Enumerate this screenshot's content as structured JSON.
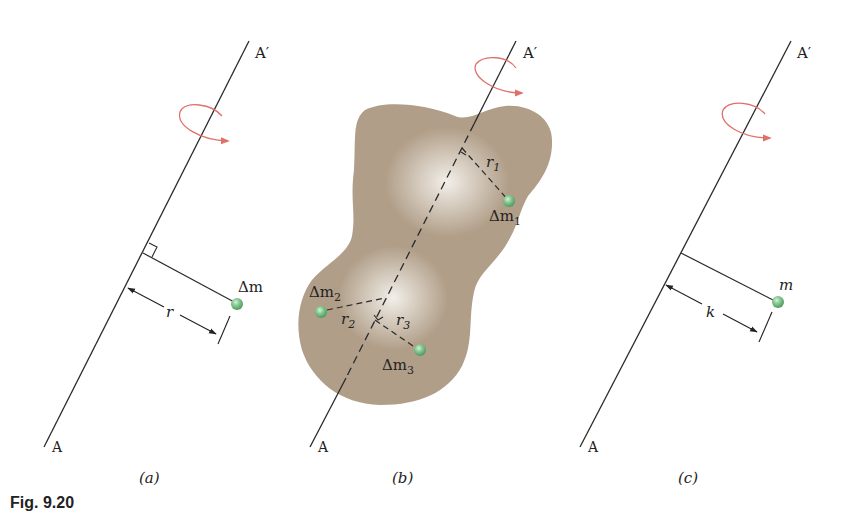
{
  "figure": {
    "caption": "Fig. 9.20",
    "colors": {
      "axis_line": "#2a2a2a",
      "rotation_arrow": "#e2706a",
      "mass_ball": "#7cc48a",
      "body_fill": "#b09e88",
      "body_highlight": "#f3efe8"
    }
  },
  "panel_a": {
    "sublabel": "(a)",
    "axis_top_label": "A′",
    "axis_bottom_label": "A",
    "mass_label": "Δm",
    "distance_label": "r"
  },
  "panel_b": {
    "sublabel": "(b)",
    "axis_top_label": "A′",
    "axis_bottom_label": "A",
    "masses": [
      {
        "label": "Δm",
        "subscript": "1",
        "distance_label": "r",
        "distance_subscript": "1"
      },
      {
        "label": "Δm",
        "subscript": "2",
        "distance_label": "r",
        "distance_subscript": "2"
      },
      {
        "label": "Δm",
        "subscript": "3",
        "distance_label": "r",
        "distance_subscript": "3"
      }
    ]
  },
  "panel_c": {
    "sublabel": "(c)",
    "axis_top_label": "A′",
    "axis_bottom_label": "A",
    "mass_label": "m",
    "distance_label": "k"
  }
}
